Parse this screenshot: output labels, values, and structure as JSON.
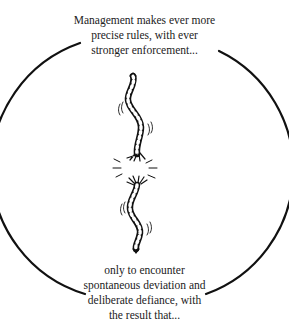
{
  "diagram": {
    "top_caption": {
      "lines": [
        "Management makes ever more",
        "precise rules, with ever",
        "stronger enforcement..."
      ]
    },
    "bottom_caption": {
      "lines": [
        "only to encounter",
        "spontaneous deviation and",
        "deliberate defiance, with",
        "the result that..."
      ]
    },
    "illustration": {
      "icon": "broken-rope-icon",
      "description": "A twisted rope snapping in the middle"
    },
    "colors": {
      "stroke": "#111111",
      "text": "#222222",
      "background": "#ffffff"
    }
  }
}
